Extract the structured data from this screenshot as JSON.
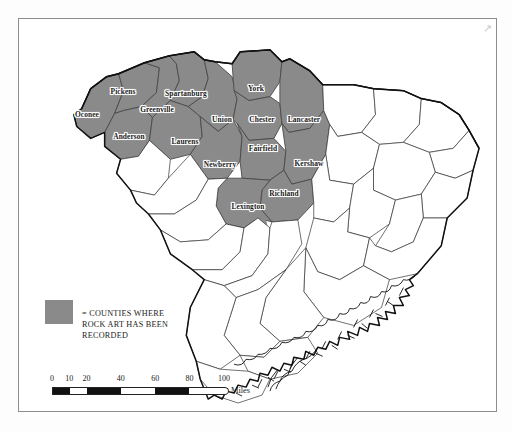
{
  "figure": {
    "corner_mark": "↗",
    "frame_color": "#8d8d8d",
    "background": "#ffffff"
  },
  "map": {
    "state": "South Carolina",
    "shaded_fill": "#8a8a8a",
    "unshaded_fill": "#ffffff",
    "boundary_color": "#1a1a1a",
    "county_border_color": "#444444",
    "shaded_counties": [
      {
        "name": "Oconee",
        "x": 68,
        "y": 95
      },
      {
        "name": "Pickens",
        "x": 104,
        "y": 72
      },
      {
        "name": "Anderson",
        "x": 110,
        "y": 117
      },
      {
        "name": "Greenville",
        "x": 138,
        "y": 90
      },
      {
        "name": "Spartanburg",
        "x": 167,
        "y": 74
      },
      {
        "name": "Laurens",
        "x": 166,
        "y": 122
      },
      {
        "name": "Union",
        "x": 203,
        "y": 100
      },
      {
        "name": "Newberry",
        "x": 201,
        "y": 145
      },
      {
        "name": "York",
        "x": 237,
        "y": 69
      },
      {
        "name": "Chester",
        "x": 243,
        "y": 100
      },
      {
        "name": "Fairfield",
        "x": 244,
        "y": 129
      },
      {
        "name": "Lancaster",
        "x": 285,
        "y": 100
      },
      {
        "name": "Kershaw",
        "x": 290,
        "y": 144
      },
      {
        "name": "Richland",
        "x": 265,
        "y": 174
      },
      {
        "name": "Lexington",
        "x": 229,
        "y": 187
      }
    ],
    "shaded_county_count": 15
  },
  "legend": {
    "symbol": "=",
    "text": "= COUNTIES WHERE\nROCK ART HAS BEEN\nRECORDED",
    "swatch_color": "#8a8a8a"
  },
  "scale": {
    "unit_label": "Miles",
    "ticks": [
      {
        "label": "0",
        "value": 0
      },
      {
        "label": "10",
        "value": 10
      },
      {
        "label": "20",
        "value": 20
      },
      {
        "label": "40",
        "value": 40
      },
      {
        "label": "60",
        "value": 60
      },
      {
        "label": "80",
        "value": 80
      },
      {
        "label": "100",
        "value": 100
      }
    ],
    "segments": [
      {
        "from": 0,
        "to": 10,
        "fill": "#111111"
      },
      {
        "from": 10,
        "to": 20,
        "fill": "#ffffff"
      },
      {
        "from": 20,
        "to": 40,
        "fill": "#111111"
      },
      {
        "from": 40,
        "to": 60,
        "fill": "#ffffff"
      },
      {
        "from": 60,
        "to": 80,
        "fill": "#111111"
      },
      {
        "from": 80,
        "to": 100,
        "fill": "#ffffff"
      }
    ],
    "max": 100
  }
}
